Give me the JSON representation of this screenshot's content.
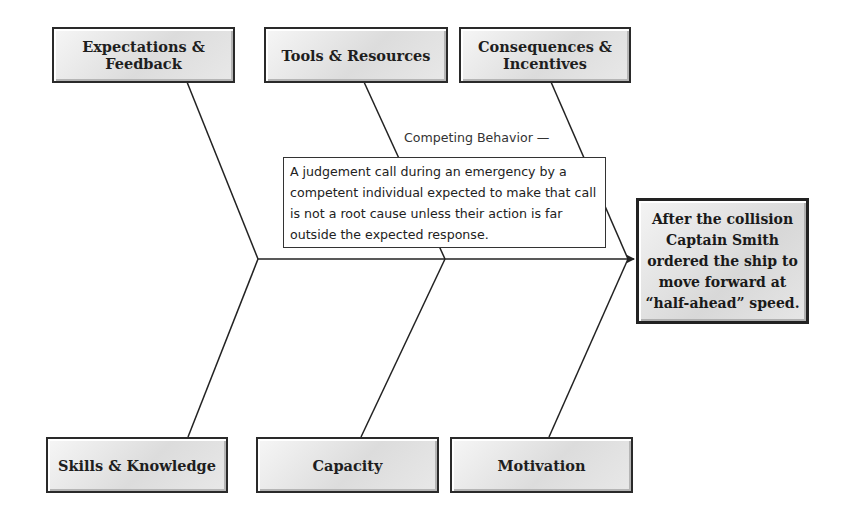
{
  "diagram": {
    "type": "fishbone",
    "effect": {
      "text": "After the collision Captain Smith ordered the ship to move forward at “half-ahead” speed."
    },
    "categories_top": [
      {
        "label": "Expectations & Feedback"
      },
      {
        "label": "Tools & Resources"
      },
      {
        "label": "Consequences & Incentives"
      }
    ],
    "categories_bottom": [
      {
        "label": "Skills & Knowledge"
      },
      {
        "label": "Capacity"
      },
      {
        "label": "Motivation"
      }
    ],
    "callout": {
      "label": "Competing Behavior —",
      "text": "A judgement call during an emergency by a competent individual expected to make that call is not a root cause unless their action is far outside the expected response."
    }
  }
}
